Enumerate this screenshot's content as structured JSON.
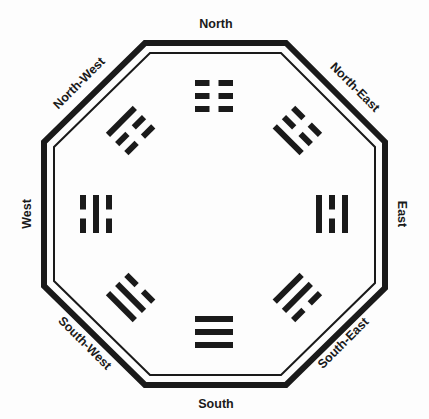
{
  "diagram": {
    "type": "bagua",
    "center": [
      214,
      214
    ],
    "colors": {
      "ink": "#1a1a1a",
      "background": "#fdfdfd"
    },
    "directions": [
      {
        "id": "north",
        "label": "North",
        "trigram": "kun",
        "lines_outer_to_inner": [
          "broken",
          "broken",
          "broken"
        ]
      },
      {
        "id": "north-east",
        "label": "North-East",
        "trigram": "zhen",
        "lines_outer_to_inner": [
          "broken",
          "broken",
          "solid"
        ]
      },
      {
        "id": "east",
        "label": "East",
        "trigram": "li",
        "lines_outer_to_inner": [
          "solid",
          "broken",
          "solid"
        ]
      },
      {
        "id": "south-east",
        "label": "South-East",
        "trigram": "dui",
        "lines_outer_to_inner": [
          "broken",
          "solid",
          "solid"
        ]
      },
      {
        "id": "south",
        "label": "South",
        "trigram": "qian",
        "lines_outer_to_inner": [
          "solid",
          "solid",
          "solid"
        ]
      },
      {
        "id": "south-west",
        "label": "South-West",
        "trigram": "xun",
        "lines_outer_to_inner": [
          "solid",
          "solid",
          "broken"
        ]
      },
      {
        "id": "west",
        "label": "West",
        "trigram": "kan",
        "lines_outer_to_inner": [
          "broken",
          "solid",
          "broken"
        ]
      },
      {
        "id": "north-west",
        "label": "North-West",
        "trigram": "gen",
        "lines_outer_to_inner": [
          "solid",
          "broken",
          "broken"
        ]
      }
    ]
  }
}
